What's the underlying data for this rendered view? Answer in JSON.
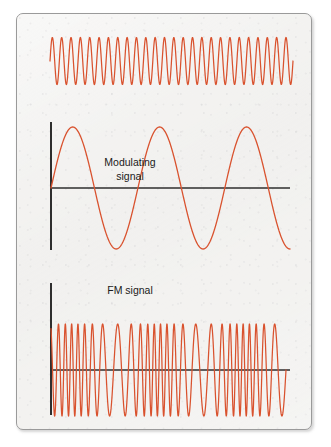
{
  "figure": {
    "title": "",
    "frame": {
      "border_color": "#9a9a9a",
      "background_color": "#f3f2f0"
    },
    "wave_color": "#d9522e",
    "axis_color": "#2e2e2e",
    "text_color": "#1a1a1a"
  },
  "labels": {
    "modulating_line1": "Modulating",
    "modulating_line2": "signal",
    "fm_signal": "FM signal"
  },
  "chart_data": {
    "type": "line",
    "title": "",
    "subtitle": "",
    "xlabel": "",
    "ylabel": "",
    "grid": false,
    "legend": "none",
    "panels": [
      {
        "name": "carrier-wave",
        "label": "",
        "waveform": "sine",
        "description": "Unmodulated high-frequency carrier wave",
        "cycles": 26,
        "amplitude": 23.5,
        "x_start": 50,
        "x_end": 293,
        "y_center": 61,
        "has_axes": false,
        "axis_h_y": null,
        "axis_v_x": null
      },
      {
        "name": "modulating-signal",
        "label": "Modulating signal",
        "waveform": "sine",
        "description": "Low-frequency modulating sine wave",
        "cycles": 2.75,
        "amplitude": 61,
        "x_start": 51,
        "x_end": 290,
        "y_center": 188,
        "has_axes": true,
        "axis_h_y": 188,
        "axis_h_x_start": 51,
        "axis_h_x_end": 290,
        "axis_v_x": 51,
        "axis_v_y_top": 122,
        "axis_v_y_bottom": 250,
        "label_x": 130,
        "label_y": 170
      },
      {
        "name": "fm-signal",
        "label": "FM signal",
        "waveform": "frequency-modulated-sine",
        "description": "Carrier frequency varies with the modulating signal amplitude",
        "carrier_cycles": 26,
        "modulation_index": 0.45,
        "amplitude": 46,
        "x_start": 51,
        "x_end": 286,
        "y_center": 370,
        "has_axes": true,
        "axis_h_y": 370,
        "axis_h_x_start": 51,
        "axis_h_x_end": 290,
        "axis_v_x": 51,
        "axis_v_y_top": 283,
        "axis_v_y_bottom": 415,
        "label_x": 130,
        "label_y": 291
      }
    ]
  }
}
